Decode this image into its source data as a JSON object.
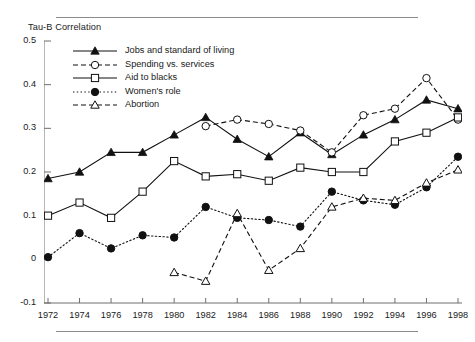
{
  "figure": {
    "y_axis_title": "Tau-B Correlation"
  },
  "legend": {
    "items": [
      {
        "label": "Jobs and standard of living",
        "marker": "filled-triangle-icon",
        "line": "solid"
      },
      {
        "label": "Spending vs. services",
        "marker": "open-circle-icon",
        "line": "dashed"
      },
      {
        "label": "Aid to blacks",
        "marker": "open-square-icon",
        "line": "solid"
      },
      {
        "label": "Women's role",
        "marker": "filled-circle-icon",
        "line": "dotted"
      },
      {
        "label": "Abortion",
        "marker": "open-triangle-icon",
        "line": "dashed"
      }
    ]
  },
  "chart_data": {
    "type": "line",
    "title": "",
    "xlabel": "",
    "ylabel": "Tau-B Correlation",
    "x": [
      1972,
      1974,
      1976,
      1978,
      1980,
      1982,
      1984,
      1986,
      1988,
      1990,
      1992,
      1994,
      1996,
      1998
    ],
    "xticklabels": [
      "1972",
      "1974",
      "1976",
      "1978",
      "1980",
      "1982",
      "1984",
      "1986",
      "1988",
      "1990",
      "1992",
      "1994",
      "1996",
      "1998"
    ],
    "yticks": [
      -0.1,
      0,
      0.1,
      0.2,
      0.3,
      0.4,
      0.5
    ],
    "yticklabels": [
      "-0.1",
      "0",
      "0.1",
      "0.2",
      "0.3",
      "0.4",
      "0.5"
    ],
    "ylim": [
      -0.1,
      0.5
    ],
    "xlim": [
      1972,
      1998
    ],
    "grid": false,
    "legend_position": "upper-left-inside",
    "series": [
      {
        "name": "Jobs and standard of living",
        "marker": "filled-triangle",
        "line": "solid",
        "values": [
          0.185,
          0.2,
          0.245,
          0.245,
          0.285,
          0.325,
          0.275,
          0.235,
          0.29,
          0.24,
          0.285,
          0.32,
          0.365,
          0.345
        ]
      },
      {
        "name": "Spending vs. services",
        "marker": "open-circle",
        "line": "dashed",
        "values": [
          null,
          null,
          null,
          null,
          null,
          0.305,
          0.32,
          0.31,
          0.295,
          0.245,
          0.33,
          0.345,
          0.415,
          0.32
        ]
      },
      {
        "name": "Aid to blacks",
        "marker": "open-square",
        "line": "solid",
        "values": [
          0.1,
          0.13,
          0.095,
          0.155,
          0.225,
          0.19,
          0.195,
          0.18,
          0.21,
          0.2,
          0.2,
          0.27,
          0.29,
          0.325
        ]
      },
      {
        "name": "Women's role",
        "marker": "filled-circle",
        "line": "dotted",
        "values": [
          0.005,
          0.06,
          0.025,
          0.055,
          0.05,
          0.12,
          0.095,
          0.09,
          0.075,
          0.155,
          0.135,
          0.125,
          0.165,
          0.235
        ]
      },
      {
        "name": "Abortion",
        "marker": "open-triangle",
        "line": "dashed",
        "values": [
          null,
          null,
          null,
          null,
          -0.03,
          -0.05,
          0.105,
          -0.025,
          0.025,
          0.12,
          0.14,
          0.135,
          0.175,
          0.205
        ]
      }
    ]
  }
}
